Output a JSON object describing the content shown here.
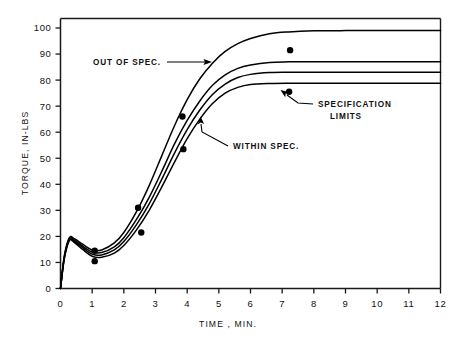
{
  "chart_data": {
    "type": "line",
    "title": "",
    "xlabel": "TIME , MIN.",
    "ylabel": "TORQUE, IN-LBS",
    "xlim": [
      0,
      12
    ],
    "ylim": [
      0,
      100
    ],
    "grid": false,
    "legend_position": "none",
    "x_ticks": [
      0,
      1,
      2,
      3,
      4,
      5,
      6,
      7,
      8,
      9,
      10,
      11,
      12
    ],
    "x_tick_labels": [
      "0",
      "1",
      "2",
      "3",
      "4",
      "5",
      "6",
      "7",
      "8",
      "9",
      "10",
      "11",
      "12"
    ],
    "y_ticks": [
      0,
      10,
      20,
      30,
      40,
      50,
      60,
      70,
      80,
      90,
      100
    ],
    "y_tick_labels": [
      "0",
      "10",
      "20",
      "30",
      "40",
      "50",
      "60",
      "70",
      "80",
      "90",
      "100"
    ],
    "series": [
      {
        "name": "upper curve (out of spec)",
        "x": [
          0.0,
          0.12,
          0.28,
          0.45,
          0.7,
          1.0,
          1.3,
          1.7,
          2.0,
          2.4,
          2.8,
          3.2,
          3.6,
          4.0,
          4.4,
          4.8,
          5.2,
          5.6,
          6.0,
          6.6,
          7.2,
          8.0,
          9.0,
          10.0,
          11.0,
          12.0
        ],
        "y": [
          0,
          12.5,
          19.5,
          19.0,
          17.0,
          14.8,
          14.8,
          17.5,
          21.5,
          29.5,
          39.5,
          51.0,
          62.5,
          72.5,
          80.5,
          86.5,
          91.0,
          94.0,
          96.0,
          97.8,
          98.5,
          98.9,
          99.0,
          99.0,
          99.0,
          99.0
        ]
      },
      {
        "name": "upper specification limit",
        "x": [
          0.0,
          0.12,
          0.28,
          0.45,
          0.7,
          1.0,
          1.3,
          1.7,
          2.0,
          2.4,
          2.8,
          3.2,
          3.6,
          4.0,
          4.4,
          4.8,
          5.2,
          5.6,
          6.0,
          6.6,
          7.2,
          8.0,
          9.0,
          10.0,
          11.0,
          12.0
        ],
        "y": [
          0,
          12.0,
          19.0,
          18.5,
          16.3,
          14.0,
          13.8,
          16.0,
          19.5,
          26.5,
          35.0,
          45.0,
          55.5,
          64.5,
          72.0,
          78.0,
          82.0,
          84.5,
          85.8,
          86.8,
          87.0,
          87.0,
          87.0,
          87.0,
          87.0,
          87.0
        ]
      },
      {
        "name": "within spec nominal",
        "x": [
          0.0,
          0.12,
          0.28,
          0.45,
          0.7,
          1.0,
          1.3,
          1.7,
          2.0,
          2.4,
          2.8,
          3.2,
          3.6,
          4.0,
          4.4,
          4.8,
          5.2,
          5.6,
          6.0,
          6.6,
          7.2,
          8.0,
          9.0,
          10.0,
          11.0,
          12.0
        ],
        "y": [
          0,
          11.7,
          18.7,
          18.0,
          15.7,
          13.2,
          12.9,
          14.8,
          18.0,
          24.5,
          32.5,
          42.0,
          52.0,
          61.0,
          68.5,
          74.5,
          78.5,
          81.0,
          82.2,
          82.9,
          83.0,
          83.0,
          83.0,
          83.0,
          83.0,
          83.0
        ]
      },
      {
        "name": "lower specification limit",
        "x": [
          0.0,
          0.12,
          0.28,
          0.45,
          0.7,
          1.0,
          1.3,
          1.7,
          2.0,
          2.4,
          2.8,
          3.2,
          3.6,
          4.0,
          4.4,
          4.8,
          5.2,
          5.6,
          6.0,
          6.6,
          7.2,
          8.0,
          9.0,
          10.0,
          11.0,
          12.0
        ],
        "y": [
          0,
          11.4,
          18.4,
          17.5,
          15.0,
          12.4,
          12.0,
          13.6,
          16.5,
          22.5,
          30.0,
          39.0,
          48.5,
          57.5,
          65.0,
          71.0,
          75.0,
          77.2,
          78.3,
          78.7,
          78.8,
          78.8,
          78.8,
          78.8,
          78.8,
          78.8
        ]
      }
    ],
    "scatter_points": [
      {
        "x": 1.08,
        "y": 14.5
      },
      {
        "x": 1.08,
        "y": 10.5
      },
      {
        "x": 2.45,
        "y": 31.0
      },
      {
        "x": 2.55,
        "y": 21.5
      },
      {
        "x": 3.85,
        "y": 66.0
      },
      {
        "x": 3.88,
        "y": 53.5
      },
      {
        "x": 7.25,
        "y": 91.5
      },
      {
        "x": 7.22,
        "y": 75.5
      }
    ],
    "annotations": [
      {
        "id": "out-of-spec",
        "text": "OUT OF SPEC.",
        "target_x": 5.0,
        "target_y": 88.0
      },
      {
        "id": "within-spec",
        "text": "WITHIN SPEC.",
        "target_x": 4.55,
        "target_y": 68.5
      },
      {
        "id": "specification-limits",
        "line1": "SPECIFICATION",
        "line2": "LIMITS",
        "target_x": 7.22,
        "target_y": 75.5
      }
    ]
  }
}
